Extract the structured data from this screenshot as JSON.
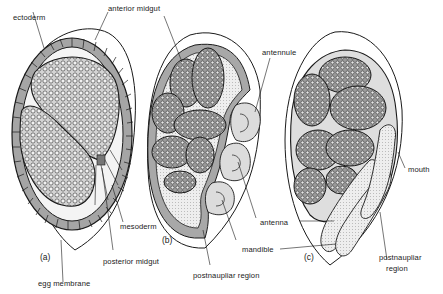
{
  "figure": {
    "panels": [
      {
        "id": "a",
        "label": "(a)"
      },
      {
        "id": "b",
        "label": "(b)"
      },
      {
        "id": "c",
        "label": "(c)"
      }
    ],
    "labels": {
      "ectoderm": "ectoderm",
      "anterior_midgut": "anterior midgut",
      "antennule": "antennule",
      "mouth": "mouth",
      "mesoderm": "mesoderm",
      "posterior_midgut": "posterior midgut",
      "egg_membrane": "egg membrane",
      "antenna": "antenna",
      "mandible": "mandible",
      "postnaupliar_region_b": "postnaupliar region",
      "postnaupliar_region_c_line1": "postnaupliar",
      "postnaupliar_region_c_line2": "region"
    },
    "colors": {
      "ink": "#1a1a1a",
      "yolk_fill": "#c9c9c9",
      "cell_fill": "#a9a9a9",
      "light_fill": "#e6e6e6",
      "background": "#ffffff"
    }
  }
}
